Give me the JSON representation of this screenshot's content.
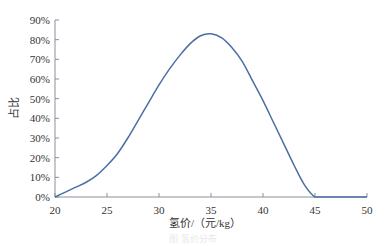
{
  "chart_data": {
    "type": "line",
    "title": "",
    "xlabel": "氢价/（元/kg）",
    "ylabel": "占比",
    "xlim": [
      20,
      50
    ],
    "ylim": [
      0,
      90
    ],
    "x_ticks": [
      20,
      25,
      30,
      35,
      40,
      45,
      50
    ],
    "y_ticks": [
      "0%",
      "10%",
      "20%",
      "30%",
      "40%",
      "50%",
      "60%",
      "70%",
      "80%",
      "90%"
    ],
    "grid": false,
    "legend": null,
    "series": [
      {
        "name": "占比",
        "color": "#4a6fa5",
        "x": [
          20,
          21,
          22,
          23,
          24,
          25,
          26,
          27,
          28,
          29,
          30,
          31,
          32,
          33,
          34,
          35,
          36,
          37,
          38,
          39,
          40,
          41,
          42,
          43,
          44,
          45,
          46,
          47,
          48,
          49,
          50
        ],
        "values": [
          0,
          2.5,
          5,
          7.5,
          11,
          16,
          22,
          30,
          39,
          48,
          57,
          65,
          72,
          78,
          82,
          83,
          81,
          76,
          69,
          59,
          49,
          38,
          27,
          16,
          6,
          0,
          0,
          0,
          0,
          0,
          0
        ]
      }
    ]
  },
  "caption": "图  氢价分布"
}
